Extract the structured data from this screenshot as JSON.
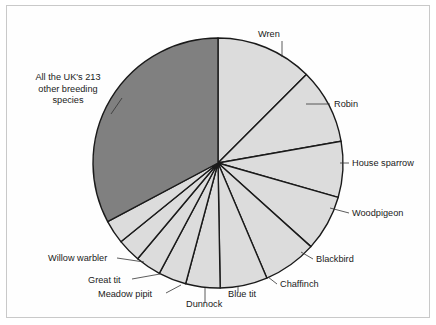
{
  "figure": {
    "background_color": "#ffffff",
    "frame_color": "#c9c9c9",
    "outline_color": "#1a1a1a"
  },
  "chart_data": {
    "type": "pie",
    "title": "",
    "subtitle": "",
    "xlabel": "",
    "ylabel": "",
    "legend_position": "none",
    "grid": false,
    "start_angle_deg": 90,
    "direction": "clockwise",
    "units": "share of UK breeding bird individuals",
    "colors": {
      "major_slice": "#808080",
      "minor_slice": "#dcdcdc",
      "slice_outline": "#1a1a1a"
    },
    "labels": [
      "Wren",
      "Robin",
      "House sparrow",
      "Woodpigeon",
      "Blackbird",
      "Chaffinch",
      "Blue tit",
      "Dunnock",
      "Meadow pipit",
      "Great tit",
      "Willow warbler",
      "All the UK's 213 other breeding species"
    ],
    "values": [
      12.5,
      9.7,
      7.2,
      7.2,
      7.0,
      6.1,
      4.4,
      3.6,
      3.3,
      3.1,
      3.1,
      32.8
    ],
    "slices": [
      {
        "label": "Wren",
        "value": 12.5,
        "angle_deg": 45.0,
        "color": "#dcdcdc",
        "label_x": 258,
        "label_y": 37,
        "anchor": "start",
        "leader": "M 282 41 L 282 57"
      },
      {
        "label": "Robin",
        "value": 9.7,
        "angle_deg": 35.0,
        "color": "#dcdcdc",
        "label_x": 334,
        "label_y": 107,
        "anchor": "start",
        "leader": "M 306 104 L 330 104"
      },
      {
        "label": "House sparrow",
        "value": 7.2,
        "angle_deg": 26.0,
        "color": "#dcdcdc",
        "label_x": 352,
        "label_y": 166,
        "anchor": "start",
        "leader": "M 340 163 L 349 163"
      },
      {
        "label": "Woodpigeon",
        "value": 7.2,
        "angle_deg": 26.0,
        "color": "#dcdcdc",
        "label_x": 352,
        "label_y": 216,
        "anchor": "start",
        "leader": "M 330 208 L 349 213"
      },
      {
        "label": "Blackbird",
        "value": 7.0,
        "angle_deg": 25.0,
        "color": "#dcdcdc",
        "label_x": 316,
        "label_y": 262,
        "anchor": "start",
        "leader": "M 301 252 L 313 259"
      },
      {
        "label": "Chaffinch",
        "value": 6.1,
        "angle_deg": 22.0,
        "color": "#dcdcdc",
        "label_x": 280,
        "label_y": 287,
        "anchor": "start",
        "leader": "M 268 277 L 277 284"
      },
      {
        "label": "Blue tit",
        "value": 4.4,
        "angle_deg": 16.0,
        "color": "#dcdcdc",
        "label_x": 228,
        "label_y": 297,
        "anchor": "start",
        "leader": "M 238 286 L 238 293"
      },
      {
        "label": "Dunnock",
        "value": 3.6,
        "angle_deg": 13.0,
        "color": "#dcdcdc",
        "label_x": 186,
        "label_y": 307,
        "anchor": "start",
        "leader": "M 205 288 L 205 303"
      },
      {
        "label": "Meadow pipit",
        "value": 3.3,
        "angle_deg": 12.0,
        "color": "#dcdcdc",
        "label_x": 98,
        "label_y": 297,
        "anchor": "start",
        "leader": "M 181 285 L 166 293"
      },
      {
        "label": "Great tit",
        "value": 3.1,
        "angle_deg": 11.0,
        "color": "#dcdcdc",
        "label_x": 88,
        "label_y": 283,
        "anchor": "start",
        "leader": "M 160 274 L 132 279"
      },
      {
        "label": "Willow warbler",
        "value": 3.1,
        "angle_deg": 11.0,
        "color": "#dcdcdc",
        "label_x": 48,
        "label_y": 261,
        "anchor": "start",
        "leader": "M 144 262 L 117 258"
      },
      {
        "label": "All the UK's 213 other breeding species",
        "value": 32.8,
        "angle_deg": 118.0,
        "color": "#808080",
        "label_x": 68,
        "label_y": 80,
        "anchor": "middle",
        "leader": "M 111 114 L 122 98",
        "lines": [
          "All the UK's 213",
          "other breeding",
          "species"
        ]
      }
    ]
  },
  "geometry": {
    "center_x": 218,
    "center_y": 163,
    "radius": 125
  }
}
